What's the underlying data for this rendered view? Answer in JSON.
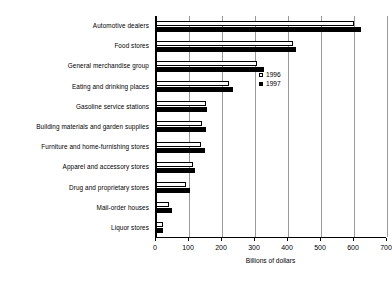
{
  "chart_data": {
    "type": "bar",
    "orientation": "horizontal",
    "title": "",
    "xlabel": "Billions of dollars",
    "ylabel": "",
    "xlim": [
      0,
      700
    ],
    "xticks": [
      0,
      100,
      200,
      300,
      400,
      500,
      600,
      700
    ],
    "xtick_labels": [
      "0",
      "100",
      "200",
      "300",
      "400",
      "500",
      "600",
      "700"
    ],
    "grid": true,
    "grid_axis": "x",
    "legend_position": "inside-right",
    "categories": [
      "Automotive dealers",
      "Food stores",
      "General merchandise group",
      "Eating and drinking places",
      "Gasoline service stations",
      "Building materials and garden supplies",
      "Furniture and home-furnishing stores",
      "Apparel and accessory stores",
      "Drug and proprietary stores",
      "Mail-order houses",
      "Liquor stores"
    ],
    "series": [
      {
        "name": "1996",
        "color": "#ffffff",
        "edge_color": "#000000",
        "values": [
          600,
          415,
          305,
          222,
          152,
          138,
          137,
          112,
          92,
          40,
          20
        ]
      },
      {
        "name": "1997",
        "color": "#000000",
        "edge_color": "#000000",
        "values": [
          620,
          425,
          328,
          232,
          155,
          150,
          147,
          118,
          102,
          48,
          22
        ]
      }
    ]
  },
  "legend": {
    "entries": [
      {
        "label": "1996",
        "swatch": "hollow-square"
      },
      {
        "label": "1997",
        "swatch": "filled-square"
      }
    ]
  },
  "axis": {
    "x_title": "Billions of dollars"
  },
  "footer": {
    "artifact_text": ""
  },
  "colors": {
    "background": "#ffffff",
    "axis": "#000000",
    "grid": "#9a9a9a",
    "series_1996": "#ffffff",
    "series_1997": "#000000"
  }
}
